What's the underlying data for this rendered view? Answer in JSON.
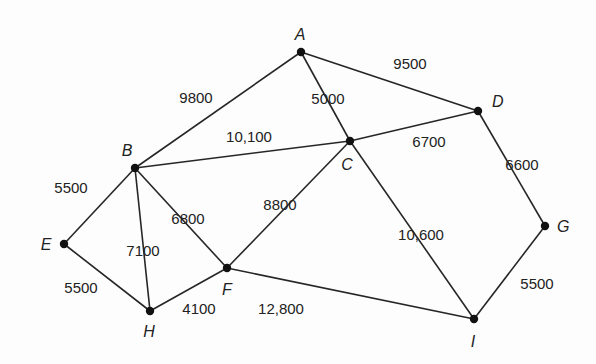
{
  "diagram": {
    "type": "weighted-undirected-graph",
    "nodes": [
      {
        "id": "A",
        "label": "A",
        "x": 301,
        "y": 52,
        "lx": 300,
        "ly": 40,
        "anchor": "middle"
      },
      {
        "id": "B",
        "label": "B",
        "x": 135,
        "y": 168,
        "lx": 127,
        "ly": 156,
        "anchor": "middle"
      },
      {
        "id": "C",
        "label": "C",
        "x": 350,
        "y": 141,
        "lx": 347,
        "ly": 170,
        "anchor": "middle"
      },
      {
        "id": "D",
        "label": "D",
        "x": 478,
        "y": 111,
        "lx": 492,
        "ly": 107,
        "anchor": "start"
      },
      {
        "id": "E",
        "label": "E",
        "x": 64,
        "y": 244,
        "lx": 46,
        "ly": 250,
        "anchor": "middle"
      },
      {
        "id": "F",
        "label": "F",
        "x": 227,
        "y": 268,
        "lx": 227,
        "ly": 295,
        "anchor": "middle"
      },
      {
        "id": "G",
        "label": "G",
        "x": 545,
        "y": 226,
        "lx": 557,
        "ly": 232,
        "anchor": "start"
      },
      {
        "id": "H",
        "label": "H",
        "x": 150,
        "y": 311,
        "lx": 149,
        "ly": 337,
        "anchor": "middle"
      },
      {
        "id": "I",
        "label": "I",
        "x": 474,
        "y": 319,
        "lx": 473,
        "ly": 347,
        "anchor": "middle"
      }
    ],
    "edges": [
      {
        "from": "A",
        "to": "B",
        "weight": "9800",
        "lx": 196,
        "ly": 103
      },
      {
        "from": "A",
        "to": "D",
        "weight": "9500",
        "lx": 410,
        "ly": 69
      },
      {
        "from": "A",
        "to": "C",
        "weight": "5000",
        "lx": 328,
        "ly": 104
      },
      {
        "from": "B",
        "to": "C",
        "weight": "10,100",
        "lx": 249,
        "ly": 142
      },
      {
        "from": "C",
        "to": "D",
        "weight": "6700",
        "lx": 429,
        "ly": 147
      },
      {
        "from": "D",
        "to": "G",
        "weight": "6600",
        "lx": 522,
        "ly": 170
      },
      {
        "from": "B",
        "to": "E",
        "weight": "5500",
        "lx": 71,
        "ly": 193
      },
      {
        "from": "B",
        "to": "H",
        "weight": "7100",
        "lx": 143,
        "ly": 256
      },
      {
        "from": "B",
        "to": "F",
        "weight": "6800",
        "lx": 188,
        "ly": 224
      },
      {
        "from": "C",
        "to": "F",
        "weight": "8800",
        "lx": 280,
        "ly": 210
      },
      {
        "from": "C",
        "to": "I",
        "weight": "10,600",
        "lx": 421,
        "ly": 240
      },
      {
        "from": "E",
        "to": "H",
        "weight": "5500",
        "lx": 81,
        "ly": 293
      },
      {
        "from": "H",
        "to": "F",
        "weight": "4100",
        "lx": 199,
        "ly": 314
      },
      {
        "from": "F",
        "to": "I",
        "weight": "12,800",
        "lx": 281,
        "ly": 314
      },
      {
        "from": "G",
        "to": "I",
        "weight": "5500",
        "lx": 537,
        "ly": 289
      }
    ]
  }
}
